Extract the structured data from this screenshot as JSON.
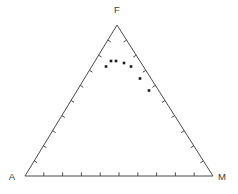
{
  "figure": {
    "type": "ternary-scatter",
    "background_color": "#ffffff",
    "line_color": "#4a4a4a",
    "point_color": "#1a1a1a",
    "label_color": "#3a3a3a"
  },
  "chart_data": {
    "type": "scatter",
    "title": "",
    "subtitle": "",
    "plot_kind": "ternary",
    "xlabel": "",
    "ylabel": "",
    "grid": false,
    "legend": null,
    "axis_ranges": {
      "A": [
        0,
        100
      ],
      "F": [
        0,
        100
      ],
      "M": [
        0,
        100
      ]
    },
    "tick_count_per_edge": 9,
    "tick_interval_percent": 10,
    "vertices": [
      {
        "name": "vertex-F",
        "label": "F",
        "position": "top"
      },
      {
        "name": "vertex-A",
        "label": "A",
        "position": "bottom-left"
      },
      {
        "name": "vertex-M",
        "label": "M",
        "position": "bottom-right"
      }
    ],
    "series": [
      {
        "name": "samples",
        "marker": "square",
        "marker_size": 2.6,
        "color": "#1a1a1a",
        "points": [
          {
            "A": 44,
            "F": 73,
            "M": -17,
            "px": 106.0,
            "py": 66.5
          },
          {
            "A": 37,
            "F": 76,
            "M": -13,
            "px": 111.0,
            "py": 61.0
          },
          {
            "A": 32,
            "F": 76,
            "M": -8,
            "px": 116.0,
            "py": 61.0
          },
          {
            "A": 28,
            "F": 75,
            "M": -3,
            "px": 124.0,
            "py": 63.0
          },
          {
            "A": 25,
            "F": 73,
            "M": 2,
            "px": 131.0,
            "py": 66.5
          },
          {
            "A": 18,
            "F": 65,
            "M": 17,
            "px": 140.0,
            "py": 78.5
          },
          {
            "A": 12,
            "F": 57,
            "M": 31,
            "px": 149.0,
            "py": 90.5
          }
        ]
      }
    ]
  },
  "geometry": {
    "apex": {
      "x": 117.0,
      "y": 25.0
    },
    "left": {
      "x": 25.0,
      "y": 176.0
    },
    "right": {
      "x": 213.0,
      "y": 176.0
    },
    "label_F": {
      "x": 117.0,
      "y": 13.0
    },
    "label_A": {
      "x": 12.0,
      "y": 180.0
    },
    "label_M": {
      "x": 222.0,
      "y": 180.0
    },
    "tick_length": 3.6,
    "stroke_width": 1.0
  }
}
